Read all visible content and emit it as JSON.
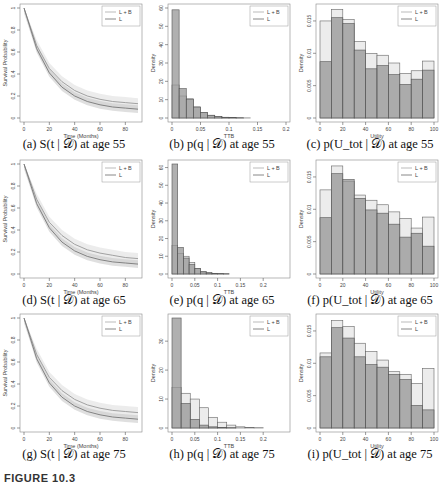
{
  "figure_label": "FIGURE 10.3",
  "legend": {
    "lb": "L + B",
    "l": "L"
  },
  "captions": [
    "(a) S(t | 𝒟) at age 55",
    "(b) p(q | 𝒟) at age 55",
    "(c) p(U_tot | 𝒟) at age 55",
    "(d) S(t | 𝒟) at age 65",
    "(e) p(q | 𝒟) at age 65",
    "(f) p(U_tot | 𝒟) at age 65",
    "(g) S(t | 𝒟) at age 75",
    "(h) p(q | 𝒟) at age 75",
    "(i) p(U_tot | 𝒟) at age 75"
  ],
  "chart_data": [
    {
      "id": "a",
      "type": "line",
      "xlabel": "Time (Months)",
      "ylabel": "Survival Probability",
      "xticks": [
        0,
        20,
        40,
        60,
        80
      ],
      "yticks": [
        0.0,
        0.2,
        0.4,
        0.6,
        0.8,
        1.0
      ],
      "xlim": [
        0,
        90
      ],
      "ylim": [
        0,
        1
      ],
      "series": [
        {
          "name": "L + B",
          "x": [
            0,
            10,
            20,
            30,
            40,
            50,
            60,
            70,
            80,
            90
          ],
          "values": [
            1.0,
            0.66,
            0.45,
            0.33,
            0.25,
            0.2,
            0.17,
            0.15,
            0.14,
            0.13
          ]
        },
        {
          "name": "L",
          "x": [
            0,
            10,
            20,
            30,
            40,
            50,
            60,
            70,
            80,
            90
          ],
          "values": [
            1.0,
            0.63,
            0.41,
            0.28,
            0.2,
            0.15,
            0.12,
            0.1,
            0.09,
            0.08
          ]
        }
      ]
    },
    {
      "id": "b",
      "type": "bar",
      "xlabel": "TTB",
      "ylabel": "Density",
      "xticks": [
        0.0,
        0.05,
        0.1,
        0.15,
        0.2
      ],
      "yticks": [
        0,
        10,
        20,
        30,
        40,
        50,
        60
      ],
      "xlim": [
        0,
        0.2
      ],
      "ylim": [
        0,
        60
      ],
      "binwidth": 0.0125,
      "series": [
        {
          "name": "L + B",
          "values": [
            18,
            12,
            10.5,
            6,
            3,
            1.5,
            0.8,
            0.4,
            0.2,
            0.1,
            0.05,
            0,
            0,
            0,
            0,
            0
          ]
        },
        {
          "name": "L",
          "values": [
            59,
            16,
            10,
            6,
            3,
            1.5,
            0.8,
            0.4,
            0.2,
            0.1,
            0,
            0,
            0,
            0,
            0,
            0
          ]
        }
      ]
    },
    {
      "id": "c",
      "type": "bar",
      "xlabel": "Utility",
      "ylabel": "Density",
      "xticks": [
        0,
        20,
        40,
        60,
        80,
        100
      ],
      "yticks": [
        0.0,
        0.005,
        0.01,
        0.015
      ],
      "xlim": [
        0,
        100
      ],
      "ylim": [
        0,
        0.017
      ],
      "binwidth": 10,
      "series": [
        {
          "name": "L + B",
          "values": [
            0.015,
            0.0168,
            0.0152,
            0.0118,
            0.01,
            0.0097,
            0.0085,
            0.0069,
            0.0073,
            0.0088
          ]
        },
        {
          "name": "L",
          "values": [
            0.0087,
            0.0155,
            0.0146,
            0.0105,
            0.0076,
            0.0081,
            0.0067,
            0.0052,
            0.006,
            0.0074
          ]
        }
      ]
    },
    {
      "id": "d",
      "type": "line",
      "xlabel": "Time (Months)",
      "ylabel": "Survival Probability",
      "xticks": [
        0,
        20,
        40,
        60,
        80
      ],
      "yticks": [
        0.0,
        0.2,
        0.4,
        0.6,
        0.8,
        1.0
      ],
      "xlim": [
        0,
        90
      ],
      "ylim": [
        0,
        1
      ],
      "series": [
        {
          "name": "L + B",
          "x": [
            0,
            10,
            20,
            30,
            40,
            50,
            60,
            70,
            80,
            90
          ],
          "values": [
            1.0,
            0.68,
            0.47,
            0.35,
            0.27,
            0.22,
            0.19,
            0.17,
            0.15,
            0.14
          ]
        },
        {
          "name": "L",
          "x": [
            0,
            10,
            20,
            30,
            40,
            50,
            60,
            70,
            80,
            90
          ],
          "values": [
            1.0,
            0.64,
            0.42,
            0.29,
            0.21,
            0.16,
            0.13,
            0.11,
            0.1,
            0.09
          ]
        }
      ]
    },
    {
      "id": "e",
      "type": "bar",
      "xlabel": "TTB",
      "ylabel": "Density",
      "xticks": [
        0.0,
        0.05,
        0.1,
        0.15,
        0.2
      ],
      "yticks": [
        0,
        10,
        20,
        30,
        40,
        50,
        60
      ],
      "xlim": [
        0,
        0.25
      ],
      "ylim": [
        0,
        62
      ],
      "binwidth": 0.0125,
      "series": [
        {
          "name": "L + B",
          "values": [
            16,
            11.5,
            10,
            6.5,
            3,
            1.5,
            0.8,
            0.4,
            0.2,
            0.1,
            0,
            0,
            0,
            0,
            0,
            0,
            0,
            0,
            0,
            0
          ]
        },
        {
          "name": "L",
          "values": [
            62,
            15,
            9,
            5.5,
            3,
            1.2,
            0.6,
            0.3,
            0.15,
            0.1,
            0,
            0,
            0,
            0,
            0,
            0,
            0,
            0,
            0,
            0
          ]
        }
      ]
    },
    {
      "id": "f",
      "type": "bar",
      "xlabel": "Utility",
      "ylabel": "Density",
      "xticks": [
        0,
        20,
        40,
        60,
        80,
        100
      ],
      "yticks": [
        0.0,
        0.005,
        0.01,
        0.015
      ],
      "xlim": [
        0,
        100
      ],
      "ylim": [
        0,
        0.017
      ],
      "binwidth": 10,
      "series": [
        {
          "name": "L + B",
          "values": [
            0.013,
            0.0167,
            0.0143,
            0.0122,
            0.0114,
            0.0107,
            0.0096,
            0.0086,
            0.0071,
            0.0088
          ]
        },
        {
          "name": "L",
          "values": [
            0.0087,
            0.0155,
            0.0146,
            0.0117,
            0.0099,
            0.0094,
            0.0077,
            0.0057,
            0.0063,
            0.0043
          ]
        }
      ]
    },
    {
      "id": "g",
      "type": "line",
      "xlabel": "Time (Months)",
      "ylabel": "Survival Probability",
      "xticks": [
        0,
        20,
        40,
        60,
        80
      ],
      "yticks": [
        0.0,
        0.2,
        0.4,
        0.6,
        0.8,
        1.0
      ],
      "xlim": [
        0,
        90
      ],
      "ylim": [
        0,
        1
      ],
      "series": [
        {
          "name": "L + B",
          "x": [
            0,
            10,
            20,
            30,
            40,
            50,
            60,
            70,
            80,
            90
          ],
          "values": [
            1.0,
            0.67,
            0.46,
            0.34,
            0.26,
            0.21,
            0.18,
            0.16,
            0.15,
            0.14
          ]
        },
        {
          "name": "L",
          "x": [
            0,
            10,
            20,
            30,
            40,
            50,
            60,
            70,
            80,
            90
          ],
          "values": [
            1.0,
            0.63,
            0.41,
            0.28,
            0.2,
            0.15,
            0.12,
            0.1,
            0.09,
            0.08
          ]
        }
      ]
    },
    {
      "id": "h",
      "type": "bar",
      "xlabel": "TTB",
      "ylabel": "Density",
      "xticks": [
        0.0,
        0.05,
        0.1,
        0.15,
        0.2
      ],
      "yticks": [
        0,
        10,
        20,
        30
      ],
      "xlim": [
        0,
        0.25
      ],
      "ylim": [
        0,
        38
      ],
      "binwidth": 0.02,
      "series": [
        {
          "name": "L + B",
          "values": [
            14,
            12,
            10,
            7,
            3.7,
            2,
            1,
            0.4,
            0.2,
            0.1,
            0,
            0
          ]
        },
        {
          "name": "L",
          "values": [
            38,
            8.5,
            3,
            1,
            0.4,
            0.2,
            0.1,
            0,
            0,
            0,
            0,
            0
          ]
        }
      ]
    },
    {
      "id": "i",
      "type": "bar",
      "xlabel": "Utility",
      "ylabel": "Density",
      "xticks": [
        0,
        20,
        40,
        60,
        80,
        100
      ],
      "yticks": [
        0.0,
        0.005,
        0.01,
        0.015
      ],
      "xlim": [
        0,
        100
      ],
      "ylim": [
        0,
        0.017
      ],
      "binwidth": 10,
      "series": [
        {
          "name": "L + B",
          "values": [
            0.0116,
            0.0166,
            0.0157,
            0.0131,
            0.0118,
            0.0105,
            0.0087,
            0.0083,
            0.0069,
            0.0092
          ]
        },
        {
          "name": "L",
          "values": [
            0.011,
            0.0155,
            0.0139,
            0.011,
            0.0098,
            0.0094,
            0.0083,
            0.0075,
            0.0035,
            0.0028
          ]
        }
      ]
    }
  ]
}
